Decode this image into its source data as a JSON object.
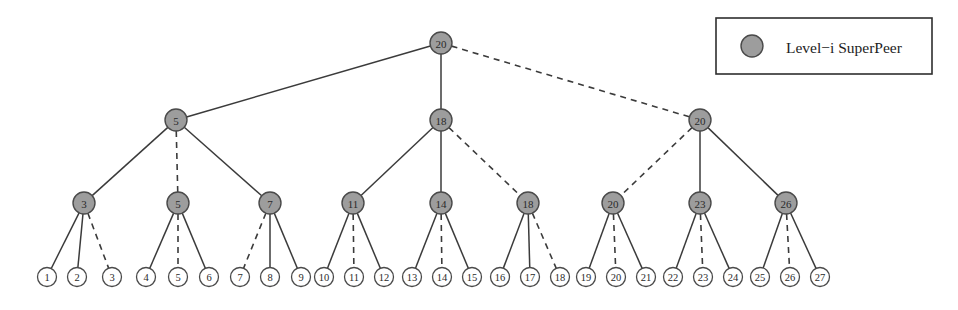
{
  "figure": {
    "width": 958,
    "height": 310,
    "background": "#ffffff"
  },
  "legend": {
    "label": "Level−i SuperPeer",
    "marker_shape": "circle",
    "marker_fill": "#9d9d9d",
    "marker_stroke": "#4a4a4a",
    "box": {
      "x": 716,
      "y": 18,
      "width": 216,
      "height": 56
    },
    "marker": {
      "cx": 752,
      "cy": 46,
      "r": 11
    },
    "text_x": 786,
    "text_y": 47
  },
  "style": {
    "node_fill": "#9d9d9d",
    "node_stroke": "#4a4a4a",
    "leaf_fill": "#ffffff",
    "leaf_stroke": "#4a4a4a",
    "edge_color": "#3b3b3b",
    "solid_label": "solid",
    "dashed_label": "dashed"
  },
  "chart_data": {
    "type": "diagram",
    "title": "",
    "levels": [
      {
        "level": 1,
        "y": 43,
        "node_radius": 11
      },
      {
        "level": 2,
        "y": 120,
        "node_radius": 11
      },
      {
        "level": 3,
        "y": 203,
        "node_radius": 11
      },
      {
        "level": 4,
        "y": 277,
        "node_radius": 9.5
      }
    ],
    "nodes": [
      {
        "id": "r",
        "label": "20",
        "kind": "superpeer",
        "level": 1,
        "x": 441,
        "y": 43,
        "r": 11
      },
      {
        "id": "a",
        "label": "5",
        "kind": "superpeer",
        "level": 2,
        "x": 176,
        "y": 120,
        "r": 11
      },
      {
        "id": "b",
        "label": "18",
        "kind": "superpeer",
        "level": 2,
        "x": 441,
        "y": 120,
        "r": 11
      },
      {
        "id": "c",
        "label": "20",
        "kind": "superpeer",
        "level": 2,
        "x": 700,
        "y": 120,
        "r": 11
      },
      {
        "id": "a1",
        "label": "3",
        "kind": "superpeer",
        "level": 3,
        "x": 84,
        "y": 203,
        "r": 11
      },
      {
        "id": "a2",
        "label": "5",
        "kind": "superpeer",
        "level": 3,
        "x": 178,
        "y": 203,
        "r": 11
      },
      {
        "id": "a3",
        "label": "7",
        "kind": "superpeer",
        "level": 3,
        "x": 270,
        "y": 203,
        "r": 11
      },
      {
        "id": "b1",
        "label": "11",
        "kind": "superpeer",
        "level": 3,
        "x": 353,
        "y": 203,
        "r": 11
      },
      {
        "id": "b2",
        "label": "14",
        "kind": "superpeer",
        "level": 3,
        "x": 441,
        "y": 203,
        "r": 11
      },
      {
        "id": "b3",
        "label": "18",
        "kind": "superpeer",
        "level": 3,
        "x": 528,
        "y": 203,
        "r": 11
      },
      {
        "id": "c1",
        "label": "20",
        "kind": "superpeer",
        "level": 3,
        "x": 613,
        "y": 203,
        "r": 11
      },
      {
        "id": "c2",
        "label": "23",
        "kind": "superpeer",
        "level": 3,
        "x": 700,
        "y": 203,
        "r": 11
      },
      {
        "id": "c3",
        "label": "26",
        "kind": "superpeer",
        "level": 3,
        "x": 786,
        "y": 203,
        "r": 11
      },
      {
        "id": "L1",
        "label": "1",
        "kind": "peer",
        "level": 4,
        "x": 47,
        "y": 277,
        "r": 9.5
      },
      {
        "id": "L2",
        "label": "2",
        "kind": "peer",
        "level": 4,
        "x": 77,
        "y": 277,
        "r": 9.5
      },
      {
        "id": "L3",
        "label": "3",
        "kind": "peer",
        "level": 4,
        "x": 112,
        "y": 277,
        "r": 9.5
      },
      {
        "id": "L4",
        "label": "4",
        "kind": "peer",
        "level": 4,
        "x": 146,
        "y": 277,
        "r": 9.5
      },
      {
        "id": "L5",
        "label": "5",
        "kind": "peer",
        "level": 4,
        "x": 178,
        "y": 277,
        "r": 9.5
      },
      {
        "id": "L6",
        "label": "6",
        "kind": "peer",
        "level": 4,
        "x": 209,
        "y": 277,
        "r": 9.5
      },
      {
        "id": "L7",
        "label": "7",
        "kind": "peer",
        "level": 4,
        "x": 240,
        "y": 277,
        "r": 9.5
      },
      {
        "id": "L8",
        "label": "8",
        "kind": "peer",
        "level": 4,
        "x": 270,
        "y": 277,
        "r": 9.5
      },
      {
        "id": "L9",
        "label": "9",
        "kind": "peer",
        "level": 4,
        "x": 301,
        "y": 277,
        "r": 9.5
      },
      {
        "id": "L10",
        "label": "10",
        "kind": "peer",
        "level": 4,
        "x": 324,
        "y": 277,
        "r": 9.5
      },
      {
        "id": "L11",
        "label": "11",
        "kind": "peer",
        "level": 4,
        "x": 354,
        "y": 277,
        "r": 9.5
      },
      {
        "id": "L12",
        "label": "12",
        "kind": "peer",
        "level": 4,
        "x": 384,
        "y": 277,
        "r": 9.5
      },
      {
        "id": "L13",
        "label": "13",
        "kind": "peer",
        "level": 4,
        "x": 412,
        "y": 277,
        "r": 9.5
      },
      {
        "id": "L14",
        "label": "14",
        "kind": "peer",
        "level": 4,
        "x": 442,
        "y": 277,
        "r": 9.5
      },
      {
        "id": "L15",
        "label": "15",
        "kind": "peer",
        "level": 4,
        "x": 472,
        "y": 277,
        "r": 9.5
      },
      {
        "id": "L16",
        "label": "16",
        "kind": "peer",
        "level": 4,
        "x": 500,
        "y": 277,
        "r": 9.5
      },
      {
        "id": "L17",
        "label": "17",
        "kind": "peer",
        "level": 4,
        "x": 530,
        "y": 277,
        "r": 9.5
      },
      {
        "id": "L18",
        "label": "18",
        "kind": "peer",
        "level": 4,
        "x": 560,
        "y": 277,
        "r": 9.5
      },
      {
        "id": "L19",
        "label": "19",
        "kind": "peer",
        "level": 4,
        "x": 586,
        "y": 277,
        "r": 9.5
      },
      {
        "id": "L20",
        "label": "20",
        "kind": "peer",
        "level": 4,
        "x": 616,
        "y": 277,
        "r": 9.5
      },
      {
        "id": "L21",
        "label": "21",
        "kind": "peer",
        "level": 4,
        "x": 646,
        "y": 277,
        "r": 9.5
      },
      {
        "id": "L22",
        "label": "22",
        "kind": "peer",
        "level": 4,
        "x": 673,
        "y": 277,
        "r": 9.5
      },
      {
        "id": "L23",
        "label": "23",
        "kind": "peer",
        "level": 4,
        "x": 703,
        "y": 277,
        "r": 9.5
      },
      {
        "id": "L24",
        "label": "24",
        "kind": "peer",
        "level": 4,
        "x": 733,
        "y": 277,
        "r": 9.5
      },
      {
        "id": "L25",
        "label": "25",
        "kind": "peer",
        "level": 4,
        "x": 760,
        "y": 277,
        "r": 9.5
      },
      {
        "id": "L26",
        "label": "26",
        "kind": "peer",
        "level": 4,
        "x": 790,
        "y": 277,
        "r": 9.5
      },
      {
        "id": "L27",
        "label": "27",
        "kind": "peer",
        "level": 4,
        "x": 820,
        "y": 277,
        "r": 9.5
      }
    ],
    "edges": [
      {
        "from": "r",
        "to": "a",
        "style": "solid"
      },
      {
        "from": "r",
        "to": "b",
        "style": "solid"
      },
      {
        "from": "r",
        "to": "c",
        "style": "dashed"
      },
      {
        "from": "a",
        "to": "a1",
        "style": "solid"
      },
      {
        "from": "a",
        "to": "a2",
        "style": "dashed"
      },
      {
        "from": "a",
        "to": "a3",
        "style": "solid"
      },
      {
        "from": "b",
        "to": "b1",
        "style": "solid"
      },
      {
        "from": "b",
        "to": "b2",
        "style": "solid"
      },
      {
        "from": "b",
        "to": "b3",
        "style": "dashed"
      },
      {
        "from": "c",
        "to": "c1",
        "style": "dashed"
      },
      {
        "from": "c",
        "to": "c2",
        "style": "solid"
      },
      {
        "from": "c",
        "to": "c3",
        "style": "solid"
      },
      {
        "from": "a1",
        "to": "L1",
        "style": "solid"
      },
      {
        "from": "a1",
        "to": "L2",
        "style": "solid"
      },
      {
        "from": "a1",
        "to": "L3",
        "style": "dashed"
      },
      {
        "from": "a2",
        "to": "L4",
        "style": "solid"
      },
      {
        "from": "a2",
        "to": "L5",
        "style": "dashed"
      },
      {
        "from": "a2",
        "to": "L6",
        "style": "solid"
      },
      {
        "from": "a3",
        "to": "L7",
        "style": "dashed"
      },
      {
        "from": "a3",
        "to": "L8",
        "style": "solid"
      },
      {
        "from": "a3",
        "to": "L9",
        "style": "solid"
      },
      {
        "from": "b1",
        "to": "L10",
        "style": "solid"
      },
      {
        "from": "b1",
        "to": "L11",
        "style": "dashed"
      },
      {
        "from": "b1",
        "to": "L12",
        "style": "solid"
      },
      {
        "from": "b2",
        "to": "L13",
        "style": "solid"
      },
      {
        "from": "b2",
        "to": "L14",
        "style": "dashed"
      },
      {
        "from": "b2",
        "to": "L15",
        "style": "solid"
      },
      {
        "from": "b3",
        "to": "L16",
        "style": "solid"
      },
      {
        "from": "b3",
        "to": "L17",
        "style": "solid"
      },
      {
        "from": "b3",
        "to": "L18",
        "style": "dashed"
      },
      {
        "from": "c1",
        "to": "L19",
        "style": "solid"
      },
      {
        "from": "c1",
        "to": "L20",
        "style": "dashed"
      },
      {
        "from": "c1",
        "to": "L21",
        "style": "solid"
      },
      {
        "from": "c2",
        "to": "L22",
        "style": "solid"
      },
      {
        "from": "c2",
        "to": "L23",
        "style": "dashed"
      },
      {
        "from": "c2",
        "to": "L24",
        "style": "solid"
      },
      {
        "from": "c3",
        "to": "L25",
        "style": "solid"
      },
      {
        "from": "c3",
        "to": "L26",
        "style": "dashed"
      },
      {
        "from": "c3",
        "to": "L27",
        "style": "solid"
      }
    ]
  }
}
